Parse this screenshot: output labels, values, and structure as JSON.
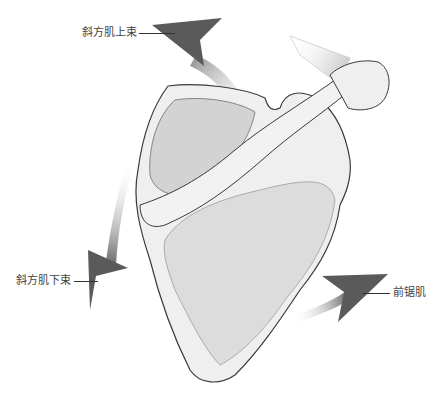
{
  "figure": {
    "labels": {
      "upper_trapezius": "斜方肌上束",
      "lower_trapezius": "斜方肌下束",
      "serratus_anterior": "前锯肌"
    },
    "arrows": [
      {
        "name": "upper-trapezius-arrow",
        "direction": "up-left"
      },
      {
        "name": "lower-trapezius-arrow",
        "direction": "down-left"
      },
      {
        "name": "serratus-anterior-arrow",
        "direction": "right"
      }
    ],
    "colors": {
      "arrow": "#5a5a5a",
      "bone_fill": "#efefef",
      "bone_stroke": "#3a3a3a",
      "shade": "#9a9a9a",
      "label_text": "#444444"
    }
  }
}
